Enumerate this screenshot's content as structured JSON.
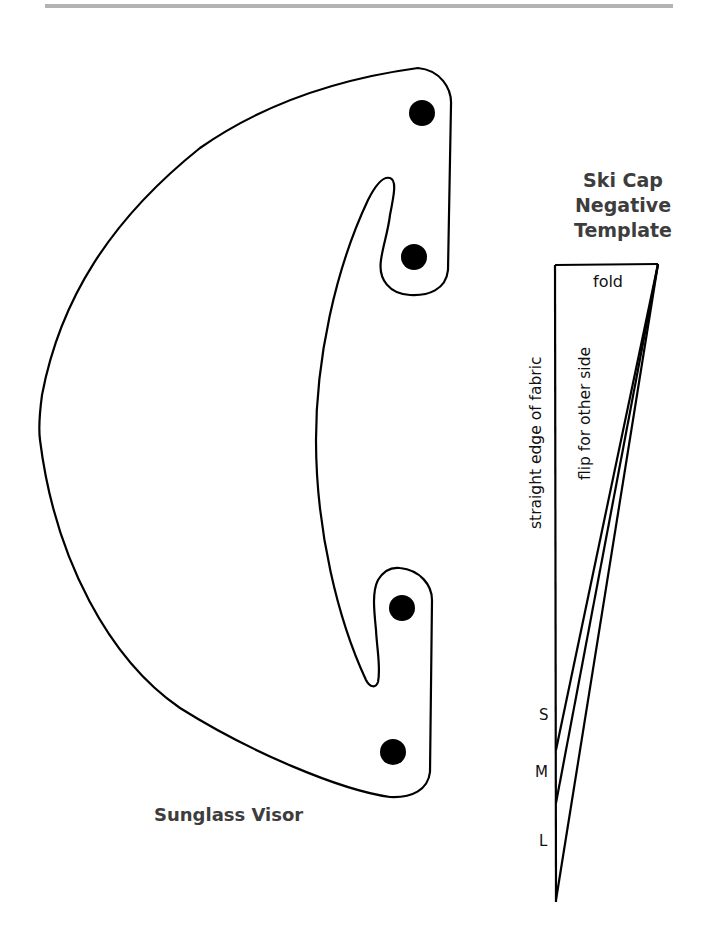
{
  "header": {
    "rule_color": "#b3b3b3"
  },
  "visor": {
    "label": "Sunglass Visor",
    "holes": [
      {
        "cx": 422,
        "cy": 113,
        "r": 13
      },
      {
        "cx": 414,
        "cy": 257,
        "r": 13
      },
      {
        "cx": 402,
        "cy": 608,
        "r": 13
      },
      {
        "cx": 393,
        "cy": 752,
        "r": 13
      }
    ]
  },
  "ski_cap": {
    "title_lines": [
      "Ski Cap",
      "Negative",
      "Template"
    ],
    "fold_label": "fold",
    "left_edge_label": "straight edge of fabric",
    "inner_label": "flip for other side",
    "sizes": [
      {
        "label": "S",
        "end_y": 750
      },
      {
        "label": "M",
        "end_y": 803
      },
      {
        "label": "L",
        "end_y": 900
      }
    ]
  },
  "colors": {
    "line": "#000000",
    "text": "#3d3d3d"
  }
}
